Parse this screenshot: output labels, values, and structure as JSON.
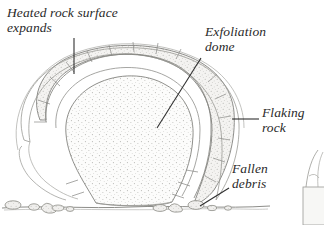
{
  "figure": {
    "background_color": "#ffffff",
    "ink_color": "#2a2a2a",
    "shell_fill": "#f2f1ef",
    "core_fill": "#fbfbfa",
    "stipple_color": "#b9b9b6"
  },
  "labels": {
    "heated": "Heated rock surface\nexpands",
    "exfoliation": "Exfoliation\ndome",
    "flaking": "Flaking\nrock",
    "fallen": "Fallen\ndebris"
  },
  "parts": {
    "dome": "exfoliation-dome",
    "shells": "flaking-rock-shells",
    "debris": "fallen-debris-rocks",
    "ground": "ground-line",
    "cropped_figure": "cropped-side-figure"
  },
  "leader_lines": {
    "heated": "vertical leader from label to dome crest",
    "exfoliation": "diagonal leader from label into dome interior",
    "flaking": "horizontal leader from label to outer shell",
    "fallen": "diagonal leader from label to debris rock"
  }
}
